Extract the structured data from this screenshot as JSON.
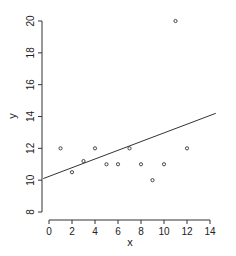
{
  "chart_data": {
    "type": "scatter",
    "title": "",
    "xlabel": "x",
    "ylabel": "y",
    "xlim": [
      0,
      14
    ],
    "ylim": [
      8,
      20
    ],
    "xticks": [
      0,
      2,
      4,
      6,
      8,
      10,
      12,
      14
    ],
    "yticks": [
      8,
      10,
      12,
      14,
      16,
      18,
      20
    ],
    "grid": false,
    "legend": null,
    "points": [
      {
        "x": 1,
        "y": 12
      },
      {
        "x": 2,
        "y": 10.5
      },
      {
        "x": 3,
        "y": 11.2
      },
      {
        "x": 4,
        "y": 12
      },
      {
        "x": 5,
        "y": 11
      },
      {
        "x": 6,
        "y": 11
      },
      {
        "x": 7,
        "y": 12
      },
      {
        "x": 8,
        "y": 11
      },
      {
        "x": 9,
        "y": 10
      },
      {
        "x": 10,
        "y": 11
      },
      {
        "x": 11,
        "y": 20
      },
      {
        "x": 12,
        "y": 12
      }
    ],
    "fit_line": {
      "x0": -0.5,
      "y0": 10.1,
      "x1": 14.5,
      "y1": 14.2
    },
    "colors": {
      "point": "#333333",
      "line": "#333333",
      "axis": "#333333"
    }
  }
}
